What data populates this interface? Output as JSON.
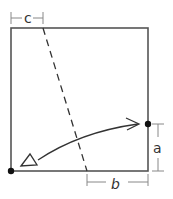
{
  "diagram": {
    "labels": {
      "a": "a",
      "b": "b",
      "c": "c"
    },
    "colors": {
      "stroke": "#333333",
      "square": "#555555",
      "background": "#ffffff"
    }
  }
}
